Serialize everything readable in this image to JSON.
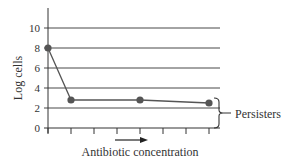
{
  "chart_data": {
    "type": "line",
    "title": "",
    "xlabel": "Antibiotic concentration",
    "ylabel": "Log cells",
    "x_ticks_count": 8,
    "y_ticks": [
      0,
      2,
      4,
      6,
      8,
      10
    ],
    "ylim": [
      0,
      11
    ],
    "grid": "horizontal",
    "points": [
      {
        "x_index": 0,
        "y": 8
      },
      {
        "x_index": 1,
        "y": 2.8
      },
      {
        "x_index": 4,
        "y": 2.8
      },
      {
        "x_index": 7,
        "y": 2.5
      }
    ],
    "annotations": [
      {
        "text": "Persisters",
        "type": "brace",
        "y_range": [
          0,
          3
        ]
      }
    ],
    "x_arrow": true
  },
  "labels": {
    "ylabel": "Log cells",
    "xlabel": "Antibiotic concentration",
    "annotation": "Persisters"
  },
  "colors": {
    "line": "#555555",
    "point": "#555555",
    "grid": "#333333",
    "text": "#333333"
  }
}
